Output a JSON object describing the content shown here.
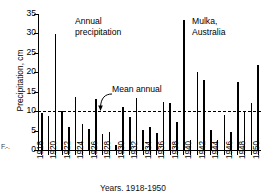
{
  "figure": {
    "marginal_label": "F.-.",
    "x_caption": "Years, 1918-1950"
  },
  "annotations": {
    "annual_precipitation": "Annual\nprecipitation",
    "location": "Mulka,\nAustralia",
    "mean_annual": "Mean annual"
  },
  "chart_data": {
    "type": "bar",
    "title": "Annual precipitation",
    "subtitle": "Mulka, Australia",
    "xlabel": "Years, 1918-1950",
    "ylabel": "Precipitation, cm",
    "ylim": [
      0,
      35
    ],
    "yticks": [
      0,
      5,
      10,
      15,
      20,
      25,
      30,
      35
    ],
    "ytick_labels": [
      "0",
      "5",
      "10",
      "15",
      "20",
      "25",
      "30",
      "35"
    ],
    "xlim": [
      1917.5,
      1950.5
    ],
    "xticks": [
      1918,
      1920,
      1922,
      1924,
      1926,
      1928,
      1930,
      1932,
      1934,
      1936,
      1938,
      1940,
      1942,
      1944,
      1946,
      1948,
      1950
    ],
    "xtick_labels": [
      "1918",
      "1920",
      "1922",
      "1924",
      "1926",
      "1928",
      "1930",
      "1932",
      "1934",
      "1936",
      "1938",
      "1940",
      "1942",
      "1944",
      "1946",
      "1948",
      "1950"
    ],
    "grid": false,
    "legend": "none",
    "bar_color": "#000000",
    "categories": [
      1918,
      1919,
      1920,
      1921,
      1922,
      1923,
      1924,
      1925,
      1926,
      1927,
      1928,
      1929,
      1930,
      1931,
      1932,
      1933,
      1934,
      1935,
      1936,
      1937,
      1938,
      1939,
      1940,
      1941,
      1942,
      1943,
      1944,
      1945,
      1946,
      1947,
      1948,
      1949,
      1950
    ],
    "values": [
      9.4,
      8.7,
      29.9,
      10.1,
      5.9,
      13.6,
      6.7,
      5.4,
      13.2,
      4.2,
      4.6,
      1.2,
      11.0,
      8.6,
      13.4,
      5.1,
      6.0,
      4.4,
      12.4,
      12.0,
      7.1,
      33.4,
      2.7,
      20.0,
      18.0,
      5.1,
      2.7,
      9.0,
      4.7,
      17.4,
      9.9,
      12.0,
      21.8
    ],
    "reference_line": {
      "label": "Mean annual",
      "value": 10.0,
      "style": "dashed",
      "color": "#000000"
    }
  }
}
